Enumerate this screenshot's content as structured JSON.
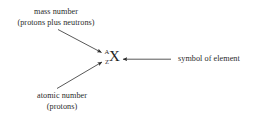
{
  "figure": {
    "background_color": "#ffffff",
    "ink_color": "#2b2b2b"
  },
  "notation": {
    "element_symbol": "X",
    "mass_number_symbol": "A",
    "atomic_number_symbol": "Z"
  },
  "labels": {
    "mass_number": {
      "line1": "mass number",
      "line2": "(protons plus neutrons)"
    },
    "atomic_number": {
      "line1": "atomic number",
      "line2": "(protons)"
    },
    "symbol_of_element": {
      "line1": "symbol of element"
    }
  },
  "annotations": [
    {
      "name": "mass-number-pointer",
      "from": "mass number label",
      "to": "A superscript",
      "direction": "down-right"
    },
    {
      "name": "atomic-number-pointer",
      "from": "atomic number label",
      "to": "Z subscript",
      "direction": "up-right"
    },
    {
      "name": "symbol-pointer",
      "from": "symbol of element label",
      "to": "X symbol",
      "direction": "left"
    }
  ]
}
